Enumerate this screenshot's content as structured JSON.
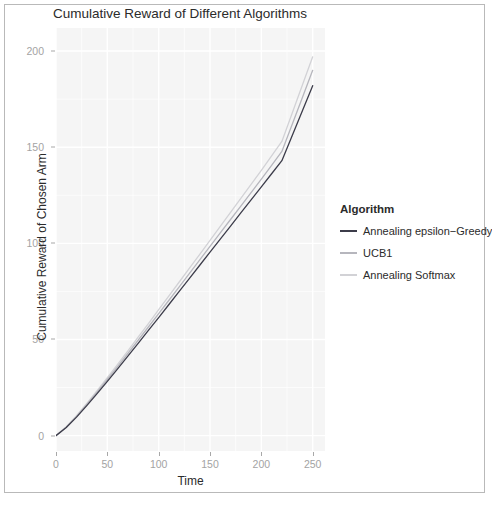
{
  "chart_data": {
    "type": "line",
    "title": "Cumulative Reward of Different Algorithms",
    "xlabel": "Time",
    "ylabel": "Cumulative Reward of Chosen Arm",
    "xlim": [
      0,
      262
    ],
    "ylim": [
      -8,
      212
    ],
    "xticks": [
      0,
      50,
      100,
      150,
      200,
      250
    ],
    "yticks": [
      0,
      50,
      100,
      150,
      200
    ],
    "xtick_labels": [
      "0",
      "50",
      "100",
      "150",
      "200",
      "250"
    ],
    "ytick_labels": [
      "0",
      "50",
      "100",
      "150",
      "200"
    ],
    "grid": true,
    "legend_position": "right",
    "legend_title": "Algorithm",
    "x": [
      0,
      10,
      20,
      30,
      40,
      50,
      60,
      70,
      80,
      90,
      100,
      110,
      120,
      130,
      140,
      150,
      160,
      170,
      180,
      190,
      200,
      210,
      220,
      230,
      240,
      250
    ],
    "series": [
      {
        "name": "Annealing epsilon-Greedy",
        "label": "Annealing epsilon−Greedy",
        "color": "#3c3c4a",
        "values": [
          0,
          4.2,
          9.6,
          15.6,
          21.8,
          28.2,
          34.7,
          41.3,
          48.0,
          54.7,
          61.4,
          68.2,
          75.0,
          81.8,
          88.6,
          95.4,
          102.2,
          109.0,
          115.8,
          122.6,
          129.4,
          136.2,
          143.0,
          156.0,
          169.0,
          182.0
        ]
      },
      {
        "name": "UCB1",
        "label": "UCB1",
        "color": "#b6b6bd",
        "values": [
          0,
          4.4,
          10.0,
          16.2,
          22.6,
          29.2,
          35.9,
          42.7,
          49.6,
          56.5,
          63.4,
          70.4,
          77.4,
          84.4,
          91.4,
          98.4,
          105.4,
          112.4,
          119.4,
          126.4,
          133.4,
          140.6,
          147.8,
          161.8,
          175.9,
          190.0
        ]
      },
      {
        "name": "Annealing Softmax",
        "label": "Annealing Softmax",
        "color": "#d2d2d6",
        "values": [
          0,
          4.6,
          10.4,
          16.8,
          23.4,
          30.2,
          37.1,
          44.1,
          51.2,
          58.3,
          65.5,
          72.7,
          79.9,
          87.1,
          94.3,
          101.5,
          108.8,
          116.1,
          123.4,
          130.7,
          138.0,
          145.5,
          153.0,
          167.7,
          182.4,
          197.0
        ]
      }
    ]
  },
  "legend": {
    "title": "Algorithm",
    "entries": [
      {
        "label": "Annealing epsilon−Greedy",
        "color": "#3c3c4a"
      },
      {
        "label": "UCB1",
        "color": "#b6b6bd"
      },
      {
        "label": "Annealing Softmax",
        "color": "#d2d2d6"
      }
    ]
  },
  "theme": {
    "panel_background": "#ececec",
    "gridline_color": "#ffffff",
    "axis_text_color": "#a3a3a3",
    "axis_title_color": "#2b2b2b",
    "border_color": "#b9b9b9"
  }
}
